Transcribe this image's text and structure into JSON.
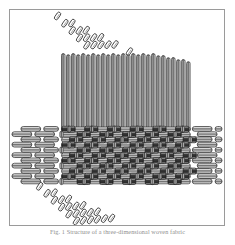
{
  "figure": {
    "caption": "Fig. 1  Structure of a three-dimensional woven fabric",
    "frame_color": "#9a9a9a",
    "background_color": "#ffffff",
    "ink_color": "#1a1a1a",
    "shade_color": "#6e6e6e"
  },
  "structure": {
    "type": "three-dimensional-woven-fabric",
    "layers": [
      {
        "name": "warp-vertical-yarns",
        "orientation": "vertical",
        "count": 26,
        "region": "upper",
        "element_shape": "round-ended-bar"
      },
      {
        "name": "bias-yarns-upper",
        "orientation": "diagonal-down-right",
        "rows": 7,
        "region": "upper",
        "element_shape": "tilted-capsule"
      },
      {
        "name": "weft-horizontal-yarns",
        "orientation": "horizontal",
        "rows": 11,
        "region": "middle",
        "element_shape": "round-ended-bar"
      },
      {
        "name": "interlaced-core",
        "orientation": "interlock",
        "region": "middle-center",
        "element_shape": "woven-lattice"
      },
      {
        "name": "bias-yarns-lower",
        "orientation": "diagonal-down-right",
        "rows": 7,
        "region": "lower",
        "element_shape": "tilted-capsule"
      }
    ]
  }
}
